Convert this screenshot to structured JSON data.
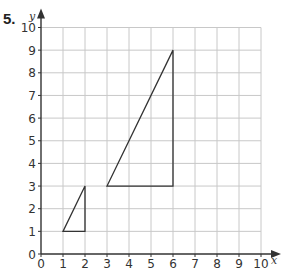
{
  "question_number": "5.",
  "chart_data": {
    "type": "diagram",
    "title": "",
    "xlabel": "x",
    "ylabel": "y",
    "xlim": [
      0,
      10
    ],
    "ylim": [
      0,
      10
    ],
    "grid": true,
    "x_ticks": [
      "0",
      "1",
      "2",
      "3",
      "4",
      "5",
      "6",
      "7",
      "8",
      "9",
      "10"
    ],
    "y_ticks": [
      "0",
      "1",
      "2",
      "3",
      "4",
      "5",
      "6",
      "7",
      "8",
      "9",
      "10"
    ],
    "shapes": [
      {
        "name": "small-triangle",
        "vertices": [
          [
            1,
            1
          ],
          [
            2,
            1
          ],
          [
            2,
            3
          ]
        ]
      },
      {
        "name": "large-triangle",
        "vertices": [
          [
            3,
            3
          ],
          [
            6,
            3
          ],
          [
            6,
            9
          ]
        ]
      }
    ]
  },
  "colors": {
    "grid": "#c8c8c8",
    "axis": "#333333",
    "shape": "#333333"
  }
}
